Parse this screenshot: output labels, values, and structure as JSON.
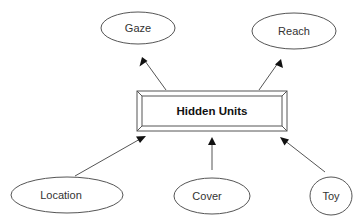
{
  "diagram": {
    "type": "network",
    "hidden": {
      "label": "Hidden Units",
      "box": {
        "x": 137,
        "y": 91,
        "w": 150,
        "h": 40,
        "bevel": 5
      }
    },
    "outputs": [
      {
        "id": "gaze",
        "label": "Gaze",
        "cx": 138,
        "cy": 28,
        "rx": 37,
        "ry": 16
      },
      {
        "id": "reach",
        "label": "Reach",
        "cx": 294,
        "cy": 31,
        "rx": 42,
        "ry": 18
      }
    ],
    "inputs": [
      {
        "id": "location",
        "label": "Location",
        "cx": 67,
        "cy": 195,
        "rx": 56,
        "ry": 18
      },
      {
        "id": "cover",
        "label": "Cover",
        "cx": 212,
        "cy": 196,
        "rx": 38,
        "ry": 18
      },
      {
        "id": "toy",
        "label": "Toy",
        "cx": 331,
        "cy": 196,
        "rx": 21,
        "ry": 19
      }
    ],
    "edges": [
      {
        "from": "hidden",
        "to": "gaze",
        "x1": 166,
        "y1": 90,
        "x2": 142,
        "y2": 57
      },
      {
        "from": "hidden",
        "to": "reach",
        "x1": 259,
        "y1": 90,
        "x2": 281,
        "y2": 59
      },
      {
        "from": "location",
        "to": "hidden",
        "x1": 75,
        "y1": 176,
        "x2": 145,
        "y2": 136
      },
      {
        "from": "cover",
        "to": "hidden",
        "x1": 212,
        "y1": 170,
        "x2": 212,
        "y2": 137
      },
      {
        "from": "toy",
        "to": "hidden",
        "x1": 325,
        "y1": 172,
        "x2": 280,
        "y2": 137
      }
    ],
    "colors": {
      "stroke": "#555555",
      "arrowhead": "#111111",
      "text": "#333333",
      "background": "#ffffff"
    }
  }
}
